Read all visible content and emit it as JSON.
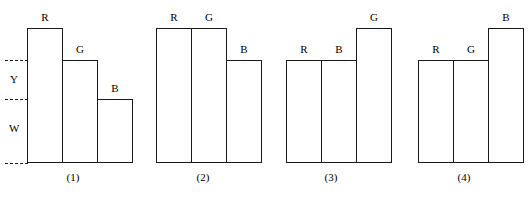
{
  "figure": {
    "type": "bar-diagram-set",
    "background": "#ffffff",
    "stroke_color": "#1a1a1a",
    "baseline_y": 163,
    "note": "Four grouped bar diagrams (1)-(4) each with three outlined bars labelled R, G, B; dashed horizontal reference levels; group (1) additionally labels two vertical bands Y and W."
  },
  "levels": {
    "y_band_label": "Y",
    "w_band_label": "W"
  },
  "groups": [
    {
      "caption": "(1)",
      "caption_x": 73,
      "caption_y": 172,
      "bars": [
        {
          "label": "R",
          "x": 27,
          "width": 36,
          "top": 28,
          "height": 135
        },
        {
          "label": "G",
          "x": 62,
          "width": 36,
          "top": 60,
          "height": 103
        },
        {
          "label": "B",
          "x": 97,
          "width": 36,
          "top": 99,
          "height": 64
        }
      ],
      "dashes": [
        {
          "x": 5,
          "width": 58,
          "y": 60
        },
        {
          "x": 5,
          "width": 93,
          "y": 99
        },
        {
          "x": 5,
          "width": 23,
          "y": 163
        }
      ],
      "side_labels": [
        {
          "text": "Y",
          "x": 10,
          "y": 74
        },
        {
          "text": "W",
          "x": 9,
          "y": 123
        }
      ]
    },
    {
      "caption": "(2)",
      "caption_x": 203,
      "caption_y": 172,
      "bars": [
        {
          "label": "R",
          "x": 156,
          "width": 36,
          "top": 28,
          "height": 135
        },
        {
          "label": "G",
          "x": 191,
          "width": 36,
          "top": 28,
          "height": 135
        },
        {
          "label": "B",
          "x": 226,
          "width": 36,
          "top": 60,
          "height": 103
        }
      ],
      "dashes": [
        {
          "x": 157,
          "width": 70,
          "y": 60
        }
      ],
      "side_labels": []
    },
    {
      "caption": "(3)",
      "caption_x": 331,
      "caption_y": 172,
      "bars": [
        {
          "label": "R",
          "x": 286,
          "width": 36,
          "top": 60,
          "height": 103
        },
        {
          "label": "B",
          "x": 321,
          "width": 36,
          "top": 60,
          "height": 103
        },
        {
          "label": "G",
          "x": 356,
          "width": 36,
          "top": 28,
          "height": 135
        }
      ],
      "dashes": [
        {
          "x": 356,
          "width": 36,
          "y": 60
        }
      ],
      "side_labels": []
    },
    {
      "caption": "(4)",
      "caption_x": 464,
      "caption_y": 172,
      "bars": [
        {
          "label": "R",
          "x": 418,
          "width": 36,
          "top": 60,
          "height": 103
        },
        {
          "label": "G",
          "x": 453,
          "width": 36,
          "top": 60,
          "height": 103
        },
        {
          "label": "B",
          "x": 488,
          "width": 36,
          "top": 28,
          "height": 135
        }
      ],
      "dashes": [
        {
          "x": 488,
          "width": 36,
          "y": 60
        }
      ],
      "side_labels": []
    }
  ]
}
